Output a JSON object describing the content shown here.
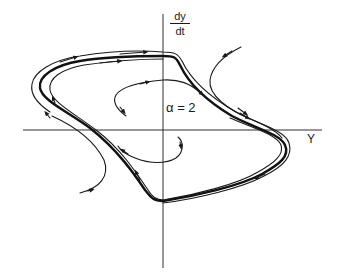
{
  "figure": {
    "type": "phase-portrait",
    "axes": {
      "vertical_label_numerator": "dy",
      "vertical_label_denominator": "dt",
      "horizontal_label": "Y"
    },
    "parameter_label": "α = 2"
  }
}
